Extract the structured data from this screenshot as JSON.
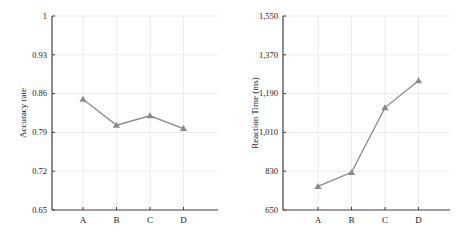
{
  "style": {
    "background": "#ffffff",
    "line_color": "#8a8a8a",
    "marker_color": "#8a8a8a",
    "axis_color": "#404040",
    "grid_color": "#ebebeb",
    "text_color": "#1a1a1a"
  },
  "chart_data": [
    {
      "type": "line",
      "title": "",
      "categories": [
        "A",
        "B",
        "C",
        "D"
      ],
      "values": [
        0.85,
        0.803,
        0.82,
        0.797
      ],
      "xlabel": "",
      "ylabel": "Accuracy rate",
      "ylim": [
        0.65,
        1
      ],
      "yticks": [
        0.65,
        0.72,
        0.79,
        0.86,
        0.93,
        1
      ],
      "ytick_labels": [
        "0.65",
        "0.72",
        "0.79",
        "0.86",
        "0.93",
        "1"
      ],
      "grid": true,
      "legend": false,
      "marker": "triangle-up"
    },
    {
      "type": "line",
      "title": "",
      "categories": [
        "A",
        "B",
        "C",
        "D"
      ],
      "values": [
        760,
        825,
        1125,
        1250
      ],
      "xlabel": "",
      "ylabel": "Reaction Time (ms)",
      "ylim": [
        650,
        1550
      ],
      "yticks": [
        650,
        830,
        1010,
        1190,
        1370,
        1550
      ],
      "ytick_labels": [
        "650",
        "830",
        "1,010",
        "1,190",
        "1,370",
        "1,550"
      ],
      "grid": true,
      "legend": false,
      "marker": "triangle-up"
    }
  ]
}
